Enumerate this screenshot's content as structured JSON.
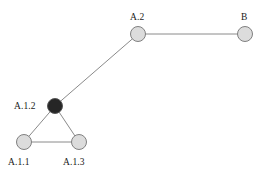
{
  "figure": {
    "type": "node-link-diagram",
    "background_color": "#ffffff",
    "width": 275,
    "height": 173
  },
  "style": {
    "node_fill": "#dcdcdc",
    "node_fill_highlight": "#262626",
    "node_stroke": "#808080",
    "node_stroke_highlight": "#565656",
    "edge_color": "#8a8a8a",
    "label_color": "#1a1a1a",
    "node_radius": 7.5,
    "edge_width": 1
  },
  "nodes": [
    {
      "id": "A.1.1",
      "label": "A.1.1",
      "cx": 24,
      "cy": 142,
      "highlighted": false,
      "label_x": 8,
      "label_y": 158
    },
    {
      "id": "A.1.2",
      "label": "A.1.2",
      "cx": 55,
      "cy": 106,
      "highlighted": true,
      "label_x": 14,
      "label_y": 102
    },
    {
      "id": "A.1.3",
      "label": "A.1.3",
      "cx": 79,
      "cy": 142,
      "highlighted": false,
      "label_x": 63,
      "label_y": 158
    },
    {
      "id": "A.2",
      "label": "A.2",
      "cx": 138,
      "cy": 34,
      "highlighted": false,
      "label_x": 130,
      "label_y": 13
    },
    {
      "id": "B",
      "label": "B",
      "cx": 245,
      "cy": 34,
      "highlighted": false,
      "label_x": 241,
      "label_y": 13
    }
  ],
  "edges": [
    {
      "id": "edge-a11-a12",
      "from": "A.1.1",
      "to": "A.1.2",
      "x1": 24,
      "y1": 142,
      "x2": 55,
      "y2": 106
    },
    {
      "id": "edge-a12-a13",
      "from": "A.1.2",
      "to": "A.1.3",
      "x1": 55,
      "y1": 106,
      "x2": 79,
      "y2": 142
    },
    {
      "id": "edge-a11-a13",
      "from": "A.1.1",
      "to": "A.1.3",
      "x1": 24,
      "y1": 142,
      "x2": 79,
      "y2": 142
    },
    {
      "id": "edge-a12-a2",
      "from": "A.1.2",
      "to": "A.2",
      "x1": 55,
      "y1": 106,
      "x2": 138,
      "y2": 34
    },
    {
      "id": "edge-a2-b",
      "from": "A.2",
      "to": "B",
      "x1": 138,
      "y1": 34,
      "x2": 245,
      "y2": 34
    }
  ]
}
